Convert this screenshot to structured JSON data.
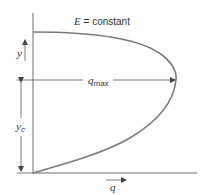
{
  "diagram": {
    "title_label": "E = constant",
    "title_var": "E",
    "title_rest": " = constant",
    "axes": {
      "vertical_label": "y",
      "horizontal_label": "q"
    },
    "annotations": {
      "qmax_var": "q",
      "qmax_sub": "max",
      "yc_var": "y",
      "yc_sub": "c"
    },
    "colors": {
      "curve": "#7a7a7a",
      "axis": "#6a6a6a",
      "text": "#333333"
    },
    "curve_description": "Specific energy curve: depth y vs unit discharge q at constant E; q reaches q_max at critical depth y_c"
  }
}
